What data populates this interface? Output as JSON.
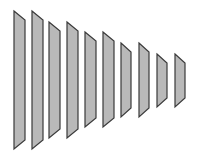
{
  "diagram": {
    "fill": "#b9b9b9",
    "stroke": "#3a3a3a",
    "bars": [
      {
        "x": 14,
        "w": 11,
        "top": 11,
        "bottom": 149
      },
      {
        "x": 32,
        "w": 11,
        "top": 11,
        "bottom": 149
      },
      {
        "x": 49,
        "w": 11,
        "top": 22,
        "bottom": 138
      },
      {
        "x": 67,
        "w": 11,
        "top": 22,
        "bottom": 138
      },
      {
        "x": 85,
        "w": 11,
        "top": 32,
        "bottom": 127
      },
      {
        "x": 103,
        "w": 11,
        "top": 32,
        "bottom": 127
      },
      {
        "x": 121,
        "w": 10,
        "top": 43,
        "bottom": 117
      },
      {
        "x": 139,
        "w": 10,
        "top": 43,
        "bottom": 117
      },
      {
        "x": 157,
        "w": 10,
        "top": 54,
        "bottom": 107
      },
      {
        "x": 175,
        "w": 10,
        "top": 54,
        "bottom": 107
      }
    ],
    "slant": 9
  }
}
